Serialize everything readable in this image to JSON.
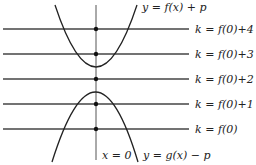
{
  "diagram": {
    "type": "function-graph",
    "axis": {
      "label": "x = 0",
      "x": 96
    },
    "curves": [
      {
        "id": "upper",
        "label": "y = f(x) + p",
        "opens": "up",
        "vertex_y": 67
      },
      {
        "id": "lower",
        "label": "y = g(x) − p",
        "opens": "down",
        "vertex_y": 92
      }
    ],
    "levels": [
      {
        "label": "k = f(0)+4",
        "y": 29
      },
      {
        "label": "k = f(0)+3",
        "y": 54
      },
      {
        "label": "k = f(0)+2",
        "y": 79
      },
      {
        "label": "k = f(0)+1",
        "y": 104
      },
      {
        "label": "k = f(0)",
        "y": 129
      }
    ],
    "colors": {
      "stroke": "#222222",
      "line": "#444444",
      "dot": "#111111"
    }
  }
}
